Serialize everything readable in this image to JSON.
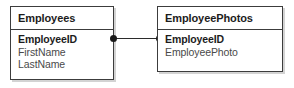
{
  "diagram": {
    "type": "entity-relationship-diagram",
    "background_color": "#ffffff",
    "border_color": "#3c3c3c",
    "text_color": "#1c1c1c",
    "field_color": "#4a4a4a",
    "connector_color": "#1a1a1a",
    "entities": [
      {
        "name": "Employees",
        "title": "Employees",
        "fields": [
          {
            "label": "EmployeeID",
            "is_key": true
          },
          {
            "label": "FirstName",
            "is_key": false
          },
          {
            "label": "LastName",
            "is_key": false
          }
        ]
      },
      {
        "name": "EmployeePhotos",
        "title": "EmployeePhotos",
        "fields": [
          {
            "label": "EmployeeID",
            "is_key": true
          },
          {
            "label": "EmployeePhoto",
            "is_key": false
          }
        ]
      }
    ],
    "relationship": {
      "from_entity": "Employees",
      "from_field": "EmployeeID",
      "to_entity": "EmployeePhotos",
      "to_field": "EmployeeID",
      "left_endpoint_icon": "filled-circle-icon",
      "right_endpoint_icon": "filled-circle-icon"
    }
  }
}
